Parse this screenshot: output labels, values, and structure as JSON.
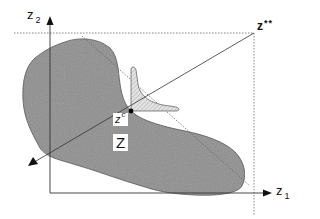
{
  "diagram": {
    "axes": {
      "x": {
        "label": "z",
        "subscript": "1"
      },
      "y": {
        "label": "z",
        "subscript": "2"
      }
    },
    "labels": {
      "ideal_point": {
        "base": "z",
        "marker": "**"
      },
      "compromise_point": {
        "base": "z",
        "marker": "c"
      },
      "region": "Z"
    },
    "colors": {
      "region_fill": "#8e8e8e",
      "axis": "#333333",
      "line": "#333333",
      "dotted": "#666666",
      "cone_fill": "#d8d8d8",
      "background": "#ffffff"
    }
  }
}
